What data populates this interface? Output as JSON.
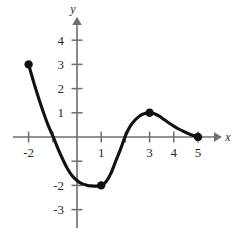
{
  "figure": {
    "name": "cubic-like-curve-graph",
    "background_color": "#ffffff",
    "curve_color": "#111111",
    "axis_color": "#6e6e6e",
    "label_color": "#2a2a2a"
  },
  "axis_names": {
    "x": "x",
    "y": "y"
  },
  "chart_data": {
    "type": "line",
    "title": "",
    "xlabel": "x",
    "ylabel": "y",
    "grid": false,
    "legend": "none",
    "xlim": [
      -2.4,
      5.8
    ],
    "ylim": [
      -3.6,
      4.7
    ],
    "x_ticks": [
      -2,
      -1,
      1,
      2,
      3,
      4,
      5
    ],
    "x_tick_labels": [
      "-2",
      "",
      "1",
      "",
      "3",
      "4",
      "5"
    ],
    "y_ticks": [
      -3,
      -2,
      -1,
      1,
      2,
      3,
      4
    ],
    "y_tick_labels": [
      "-3",
      "-2",
      "",
      "1",
      "2",
      "3",
      "4"
    ],
    "x_tick_labels_shown": [
      "-2",
      "1",
      "3",
      "4",
      "5"
    ],
    "y_tick_labels_shown": [
      "4",
      "3",
      "2",
      "1",
      "-2",
      "-3"
    ],
    "points_marked": [
      {
        "label": "left endpoint",
        "x": -2,
        "y": 3
      },
      {
        "label": "local minimum",
        "x": 1,
        "y": -2
      },
      {
        "label": "local maximum",
        "x": 3,
        "y": 1
      },
      {
        "label": "right endpoint",
        "x": 5,
        "y": 0
      }
    ],
    "x_intercepts": [
      -1.4,
      2.1
    ],
    "x": [
      -2.0,
      -1.8,
      -1.6,
      -1.4,
      -1.2,
      -1.0,
      -0.8,
      -0.6,
      -0.4,
      -0.2,
      0.0,
      0.2,
      0.4,
      0.6,
      0.8,
      1.0,
      1.2,
      1.4,
      1.6,
      1.8,
      2.0,
      2.2,
      2.4,
      2.6,
      2.8,
      3.0,
      3.2,
      3.4,
      3.6,
      3.8,
      4.0,
      4.2,
      4.4,
      4.6,
      4.8,
      5.0
    ],
    "y": [
      3.0,
      2.3,
      1.65,
      1.05,
      0.5,
      0.05,
      -0.45,
      -0.9,
      -1.3,
      -1.6,
      -1.8,
      -1.93,
      -1.99,
      -2.02,
      -2.03,
      -2.0,
      -1.85,
      -1.5,
      -1.0,
      -0.5,
      0.05,
      0.45,
      0.7,
      0.88,
      0.97,
      1.0,
      0.96,
      0.86,
      0.72,
      0.58,
      0.45,
      0.33,
      0.23,
      0.14,
      0.06,
      0.0
    ]
  }
}
